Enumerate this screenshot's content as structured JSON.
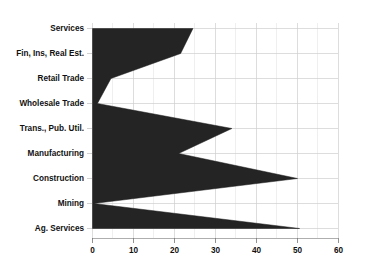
{
  "chart_data": {
    "type": "area",
    "orientation": "horizontal",
    "title": "",
    "subtitle": "",
    "xlabel": "",
    "ylabel": "",
    "categories": [
      "Services",
      "Fin, Ins, Real Est.",
      "Retail Trade",
      "Wholesale Trade",
      "Trans., Pub. Util.",
      "Manufacturing",
      "Construction",
      "Mining",
      "Ag. Services"
    ],
    "values": [
      24.5,
      21.5,
      4.5,
      1.2,
      34.0,
      21.0,
      50.0,
      0.3,
      50.5
    ],
    "series": [
      {
        "name": "",
        "values": [
          24.5,
          21.5,
          4.5,
          1.2,
          34.0,
          21.0,
          50.0,
          0.3,
          50.5
        ]
      }
    ],
    "xlim": [
      0,
      60
    ],
    "xticks": [
      0,
      10,
      20,
      30,
      40,
      50,
      60
    ],
    "xtick_labels": [
      "0",
      "10",
      "20",
      "30",
      "40",
      "50",
      "60"
    ],
    "x_minor_step": 5,
    "grid": true,
    "grid_axis": "both",
    "legend": false,
    "legend_position": "none",
    "fill_color": "#242424",
    "grid_color": "#cfcfcf",
    "background_color": "#ffffff",
    "text_color": "#111111"
  },
  "axis": {
    "x_tick_labels": [
      "0",
      "10",
      "20",
      "30",
      "40",
      "50",
      "60"
    ],
    "y_tick_labels": [
      "Services",
      "Fin, Ins, Real Est.",
      "Retail Trade",
      "Wholesale Trade",
      "Trans., Pub. Util.",
      "Manufacturing",
      "Construction",
      "Mining",
      "Ag. Services"
    ]
  }
}
